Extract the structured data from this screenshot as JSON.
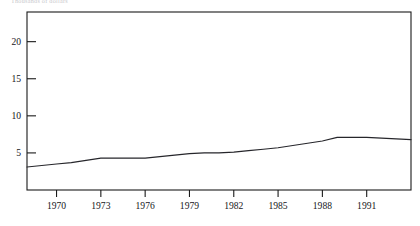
{
  "figure": {
    "caption": "Thousands of dollars",
    "background_color": "#ffffff",
    "frame_color": "#1a1a1a",
    "line_color": "#26262b"
  },
  "chart_data": {
    "type": "line",
    "title": "Thousands of dollars",
    "xlabel": "",
    "ylabel": "",
    "grid": false,
    "legend": null,
    "xlim": [
      1968,
      1994
    ],
    "ylim": [
      0,
      24
    ],
    "yticks": [
      5,
      10,
      15,
      20
    ],
    "ytick_labels": [
      "5",
      "10",
      "15",
      "20"
    ],
    "xticks": [
      1970,
      1973,
      1976,
      1979,
      1982,
      1985,
      1988,
      1991
    ],
    "xtick_labels": [
      "1970",
      "1973",
      "1976",
      "1979",
      "1982",
      "1985",
      "1988",
      "1991"
    ],
    "x": [
      1968,
      1969,
      1970,
      1971,
      1972,
      1973,
      1974,
      1975,
      1976,
      1977,
      1978,
      1979,
      1980,
      1981,
      1982,
      1983,
      1984,
      1985,
      1986,
      1987,
      1988,
      1989,
      1990,
      1991,
      1992,
      1993,
      1994
    ],
    "values": [
      3.1,
      3.3,
      3.5,
      3.7,
      4.0,
      4.3,
      4.3,
      4.3,
      4.3,
      4.5,
      4.7,
      4.9,
      5.0,
      5.0,
      5.1,
      5.3,
      5.5,
      5.7,
      6.0,
      6.3,
      6.6,
      7.1,
      7.1,
      7.1,
      7.0,
      6.9,
      6.8
    ],
    "series": [
      {
        "name": "value",
        "values": [
          3.1,
          3.3,
          3.5,
          3.7,
          4.0,
          4.3,
          4.3,
          4.3,
          4.3,
          4.5,
          4.7,
          4.9,
          5.0,
          5.0,
          5.1,
          5.3,
          5.5,
          5.7,
          6.0,
          6.3,
          6.6,
          7.1,
          7.1,
          7.1,
          7.0,
          6.9,
          6.8
        ]
      }
    ]
  }
}
